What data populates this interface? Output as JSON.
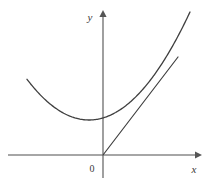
{
  "figure": {
    "background_color": "#ffffff",
    "width": 216,
    "height": 184
  },
  "axes": {
    "x_label": "x",
    "y_label": "y",
    "origin_label": "0",
    "axis_color": "#888888",
    "axis_stroke_width": 1.6,
    "arrow_color": "#555555",
    "x_axis": {
      "x_start": 8,
      "x_end": 202,
      "y": 155,
      "arrow_at": "right"
    },
    "y_axis": {
      "y_start": 10,
      "y_end": 178,
      "x": 103,
      "arrow_at": "top"
    },
    "origin_px": {
      "x": 103,
      "y": 155
    },
    "label_positions": {
      "x_label_px": {
        "x": 194,
        "y": 173
      },
      "y_label_px": {
        "x": 90,
        "y": 21
      },
      "origin_label_px": {
        "x": 92,
        "y": 172
      }
    }
  },
  "chart_data": {
    "type": "line",
    "xlabel": "x",
    "ylabel": "y",
    "grid": false,
    "legend": false,
    "curve_color": "#3f3f3f",
    "curve_stroke_width": 1.3,
    "tangent_color": "#3f3f3f",
    "tangent_stroke_width": 1.2,
    "series": [
      {
        "name": "parabola",
        "kind": "quadratic",
        "vertex_px": {
          "x": 89,
          "y": 120
        },
        "curvature_a_px": 0.01059,
        "x_range_px": [
          27,
          190
        ],
        "endpoints_px": [
          {
            "x": 27,
            "y": 15
          },
          {
            "x": 190,
            "y": 12
          }
        ]
      },
      {
        "name": "tangent-line",
        "kind": "line",
        "through_origin": true,
        "tangency_point_px": {
          "x": 157,
          "y": 92
        },
        "endpoints_px": [
          {
            "x": 103,
            "y": 155
          },
          {
            "x": 178,
            "y": 57
          }
        ]
      }
    ]
  }
}
